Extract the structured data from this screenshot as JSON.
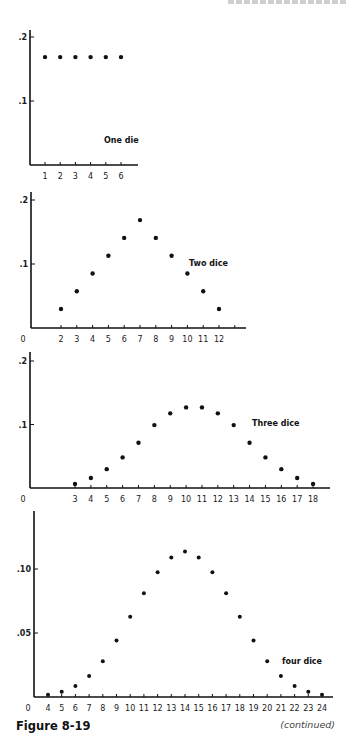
{
  "page_header": "",
  "figure": {
    "caption": "Figure 8-19",
    "continuation": "(continued)"
  },
  "chart_data": [
    {
      "type": "scatter",
      "title": "One die",
      "series_label": "One die",
      "xlabel": "",
      "ylabel": "",
      "x": [
        1,
        2,
        3,
        4,
        5,
        6
      ],
      "y": [
        0.1667,
        0.1667,
        0.1667,
        0.1667,
        0.1667,
        0.1667
      ],
      "xticks": [
        "1",
        "2",
        "3",
        "4",
        "5",
        "6"
      ],
      "yticks": [
        {
          "value": 0.2,
          "label": ".2"
        },
        {
          "value": 0.1,
          "label": ".1"
        }
      ],
      "show_zero_label": false,
      "ylim": [
        0,
        0.2
      ],
      "grid": false
    },
    {
      "type": "scatter",
      "title": "Two dice",
      "series_label": "Two dice",
      "xlabel": "",
      "ylabel": "",
      "x": [
        2,
        3,
        4,
        5,
        6,
        7,
        8,
        9,
        10,
        11,
        12
      ],
      "y": [
        0.0278,
        0.0556,
        0.0833,
        0.1111,
        0.1389,
        0.1667,
        0.1389,
        0.1111,
        0.0833,
        0.0556,
        0.0278
      ],
      "xticks": [
        "2",
        "3",
        "4",
        "5",
        "6",
        "7",
        "8",
        "9",
        "10",
        "11",
        "12"
      ],
      "yticks": [
        {
          "value": 0.2,
          "label": ".2"
        },
        {
          "value": 0.1,
          "label": ".1"
        }
      ],
      "zero_label": "0",
      "ylim": [
        0,
        0.2
      ],
      "grid": false
    },
    {
      "type": "scatter",
      "title": "Three dice",
      "series_label": "Three dice",
      "xlabel": "",
      "ylabel": "",
      "x": [
        3,
        4,
        5,
        6,
        7,
        8,
        9,
        10,
        11,
        12,
        13,
        14,
        15,
        16,
        17,
        18
      ],
      "y": [
        0.0046,
        0.0139,
        0.0278,
        0.0463,
        0.0694,
        0.0972,
        0.1157,
        0.125,
        0.125,
        0.1157,
        0.0972,
        0.0694,
        0.0463,
        0.0278,
        0.0139,
        0.0046
      ],
      "xticks": [
        "3",
        "4",
        "5",
        "6",
        "7",
        "8",
        "9",
        "10",
        "11",
        "12",
        "13",
        "14",
        "15",
        "16",
        "17",
        "18"
      ],
      "yticks": [
        {
          "value": 0.2,
          "label": ".2"
        },
        {
          "value": 0.1,
          "label": ".1"
        }
      ],
      "zero_label": "0",
      "ylim": [
        0,
        0.2
      ],
      "grid": false
    },
    {
      "type": "scatter",
      "title": "four dice",
      "series_label": "four dice",
      "xlabel": "",
      "ylabel": "",
      "x": [
        4,
        5,
        6,
        7,
        8,
        9,
        10,
        11,
        12,
        13,
        14,
        15,
        16,
        17,
        18,
        19,
        20,
        21,
        22,
        23,
        24
      ],
      "y": [
        0.0008,
        0.0031,
        0.0077,
        0.0154,
        0.027,
        0.0432,
        0.0617,
        0.0802,
        0.0965,
        0.108,
        0.1127,
        0.108,
        0.0965,
        0.0802,
        0.0617,
        0.0432,
        0.027,
        0.0154,
        0.0077,
        0.0031,
        0.0008
      ],
      "xticks": [
        "4",
        "5",
        "6",
        "7",
        "8",
        "9",
        "10",
        "11",
        "12",
        "13",
        "14",
        "15",
        "16",
        "17",
        "18",
        "19",
        "20",
        "21",
        "22",
        "23",
        "24"
      ],
      "yticks": [
        {
          "value": 0.1,
          "label": ".10"
        },
        {
          "value": 0.05,
          "label": ".05"
        }
      ],
      "zero_label": "0",
      "ylim": [
        0,
        0.145
      ],
      "grid": false
    }
  ]
}
